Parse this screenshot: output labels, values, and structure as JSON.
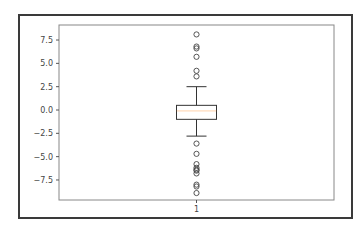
{
  "chart_data": {
    "type": "boxplot",
    "title": "",
    "xlabel": "",
    "ylabel": "",
    "categories": [
      "1"
    ],
    "ylim": [
      -9.5,
      8.5
    ],
    "yticks": [
      -7.5,
      -5.0,
      -2.5,
      0.0,
      2.5,
      5.0,
      7.5
    ],
    "ytick_labels": [
      "−7.5",
      "−5.0",
      "−2.5",
      "0.0",
      "2.5",
      "5.0",
      "7.5"
    ],
    "xtick_labels": [
      "1"
    ],
    "grid": false,
    "legend": null,
    "boxes": [
      {
        "label": "1",
        "whisker_low": -2.8,
        "q1": -1.0,
        "median": -0.1,
        "q3": 0.5,
        "whisker_high": 2.5,
        "outliers": [
          8.1,
          6.8,
          6.6,
          5.7,
          4.2,
          3.6,
          -3.6,
          -4.7,
          -5.8,
          -6.2,
          -6.4,
          -6.5,
          -6.8,
          -8.0,
          -8.2,
          -8.9
        ]
      }
    ]
  }
}
